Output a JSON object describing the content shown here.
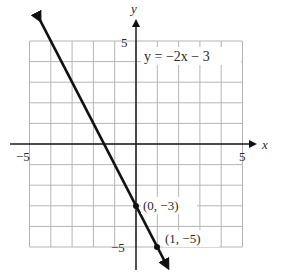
{
  "chart_data": {
    "type": "line",
    "title": "",
    "equation_label": "y = −2x − 3",
    "xlabel": "x",
    "ylabel": "y",
    "xlim": [
      -5,
      5
    ],
    "ylim": [
      -5,
      5
    ],
    "grid": true,
    "grid_step": 1,
    "x_tick_labels": [
      {
        "value": -5,
        "label": "−5"
      },
      {
        "value": 5,
        "label": "5"
      }
    ],
    "y_tick_labels": [
      {
        "value": 5,
        "label": "5"
      },
      {
        "value": -5,
        "label": "−5"
      }
    ],
    "series": [
      {
        "name": "y = -2x - 3",
        "slope": -2,
        "intercept": -3,
        "x": [
          -4.5,
          1.5
        ],
        "y": [
          6,
          -6
        ],
        "arrows_both_ends": true
      }
    ],
    "points": [
      {
        "x": 0,
        "y": -3,
        "label": "(0, −3)"
      },
      {
        "x": 1,
        "y": -5,
        "label": "(1, −5)"
      }
    ],
    "colors": {
      "line": "#111111",
      "grid": "#b5b5b5",
      "axis": "#1a1a1a"
    }
  }
}
